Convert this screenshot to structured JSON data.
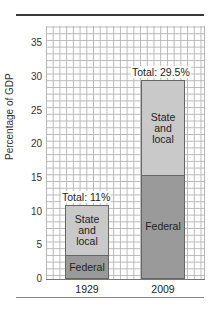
{
  "chart_data": {
    "type": "bar",
    "stacked": true,
    "title": "",
    "xlabel": "",
    "ylabel": "Percentage of GDP",
    "ylim": [
      0,
      37.5
    ],
    "yticks": [
      0,
      5,
      10,
      15,
      20,
      25,
      30,
      35
    ],
    "grid": true,
    "categories": [
      "1929",
      "2009"
    ],
    "series": [
      {
        "name": "Federal",
        "values": [
          3.5,
          15.5
        ],
        "color": "#9a9a9a"
      },
      {
        "name": "State and local",
        "values": [
          7.5,
          14.0
        ],
        "color": "#c9c9c9"
      }
    ],
    "totals": [
      11,
      29.5
    ],
    "annotations": [
      "Total: 11%",
      "Total: 29.5%"
    ]
  },
  "labels": {
    "ylabel": "Percentage of GDP",
    "yticks": [
      "0",
      "5",
      "10",
      "15",
      "20",
      "25",
      "30",
      "35"
    ],
    "bars": [
      {
        "category": "1929",
        "total_label": "Total: 11%",
        "federal_label": "Federal",
        "state_label": "State and local"
      },
      {
        "category": "2009",
        "total_label": "Total: 29.5%",
        "federal_label": "Federal",
        "state_label": "State and local"
      }
    ]
  }
}
